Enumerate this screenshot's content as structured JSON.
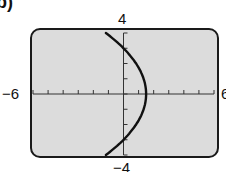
{
  "part_label": "b)",
  "window": {
    "xmin_label": "−6",
    "xmax_label": "6",
    "ymax_label": "4",
    "ymin_label": "−4"
  },
  "colors": {
    "screen_fill": "#dcdcdc",
    "frame": "#1a1a1a",
    "curve": "#111111"
  },
  "chart_data": {
    "type": "line",
    "title": "",
    "xlabel": "",
    "ylabel": "",
    "xlim": [
      -6,
      6
    ],
    "ylim": [
      -4,
      4
    ],
    "x_ticks_step": 1,
    "y_ticks_step": 1,
    "grid": false,
    "series": [
      {
        "name": "parabola opening left",
        "points": [
          {
            "x": -1.17,
            "y": 4
          },
          {
            "x": 0,
            "y": 3
          },
          {
            "x": 0.83,
            "y": 2
          },
          {
            "x": 1.33,
            "y": 1
          },
          {
            "x": 1.5,
            "y": 0
          },
          {
            "x": 1.33,
            "y": -1
          },
          {
            "x": 0.83,
            "y": -2
          },
          {
            "x": 0,
            "y": -3
          },
          {
            "x": -1.17,
            "y": -4
          }
        ]
      }
    ],
    "annotations": [
      "Viewing window: x from −6 to 6, y from −4 to 4"
    ]
  }
}
